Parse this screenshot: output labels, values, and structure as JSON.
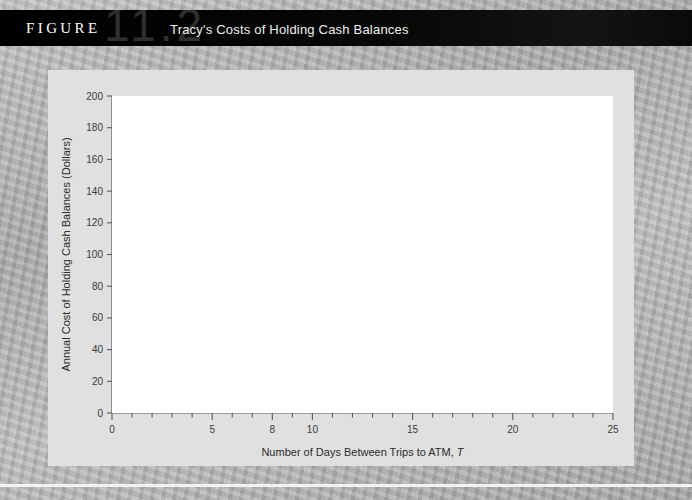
{
  "figure": {
    "label": "FIGURE",
    "number": "11.2",
    "title": "Tracy's Costs of Holding Cash Balances"
  },
  "colors": {
    "header_bg": "#000000",
    "ghost_number": "#2f2f2f",
    "panel_bg": "#e0e0e0",
    "plot_bg": "#ffffff",
    "curve": "#6e6e6e",
    "marker": "#1a1a1a",
    "axis": "#5a5a5a",
    "page_bg": "#b0b0b0"
  },
  "chart_data": {
    "type": "line",
    "title": "Tracy's Costs of Holding Cash Balances",
    "xlabel": "Number of Days Between Trips to ATM, T",
    "ylabel": "Annual Cost of Holding Cash Balances (Dollars)",
    "xlim": [
      0,
      25
    ],
    "ylim": [
      0,
      200
    ],
    "xticks": [
      0,
      5,
      8,
      10,
      15,
      20,
      25
    ],
    "xtick_labels": [
      "0",
      "5",
      "8",
      "10",
      "15",
      "20",
      "25"
    ],
    "xminor_step": 1,
    "yticks": [
      0,
      20,
      40,
      60,
      80,
      100,
      120,
      140,
      160,
      180,
      200
    ],
    "ytick_labels": [
      "0",
      "20",
      "40",
      "60",
      "80",
      "100",
      "120",
      "140",
      "160",
      "180",
      "200"
    ],
    "grid": false,
    "legend": "none",
    "markers": true,
    "x": [
      1,
      2,
      3,
      4,
      5,
      6,
      7,
      8,
      9,
      10,
      11,
      12,
      13,
      14,
      15,
      16,
      17,
      18,
      19,
      20
    ],
    "values": [
      185,
      97,
      70,
      57,
      51,
      48,
      47,
      46.7,
      47.3,
      48.5,
      50,
      51.8,
      53.7,
      55.8,
      58,
      60.3,
      62.6,
      65,
      67.5,
      70
    ],
    "annotations": [
      {
        "type": "dashed-vline",
        "x": 8,
        "y": 46.7,
        "label": "8",
        "note": "optimal number of days between trips to ATM"
      }
    ]
  }
}
